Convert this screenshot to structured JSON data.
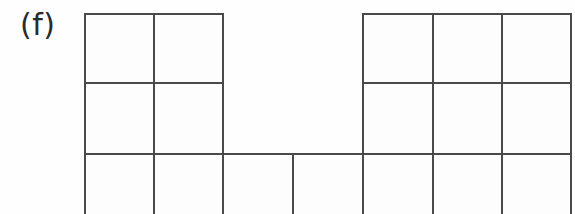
{
  "figure": {
    "panel_label": "(f)",
    "kind": "polyomino-grid-diagram",
    "background_color": "#fefefe",
    "line_color": "#4a4a4a",
    "line_width_px": 2,
    "width_px": 575,
    "height_px": 214
  },
  "grid": {
    "columns": 7,
    "rows": 3,
    "column_edges_px": [
      85,
      154,
      223,
      293,
      363,
      433,
      502,
      571
    ],
    "row_edges_px": [
      14,
      83,
      154,
      214
    ],
    "bottom_row_clipped": true,
    "filled_cells": [
      {
        "row": 0,
        "col": 0
      },
      {
        "row": 0,
        "col": 1
      },
      {
        "row": 0,
        "col": 4
      },
      {
        "row": 0,
        "col": 5
      },
      {
        "row": 0,
        "col": 6
      },
      {
        "row": 1,
        "col": 0
      },
      {
        "row": 1,
        "col": 1
      },
      {
        "row": 1,
        "col": 4
      },
      {
        "row": 1,
        "col": 5
      },
      {
        "row": 1,
        "col": 6
      },
      {
        "row": 2,
        "col": 0
      },
      {
        "row": 2,
        "col": 1
      },
      {
        "row": 2,
        "col": 2
      },
      {
        "row": 2,
        "col": 3
      },
      {
        "row": 2,
        "col": 4
      },
      {
        "row": 2,
        "col": 5
      },
      {
        "row": 2,
        "col": 6
      }
    ]
  },
  "segments": {
    "horizontal": [
      {
        "name": "top-left-block-top",
        "x1": 85,
        "x2": 223,
        "y": 14
      },
      {
        "name": "top-right-block-top",
        "x1": 363,
        "x2": 571,
        "y": 14
      },
      {
        "name": "row1-row2-divider-left",
        "x1": 85,
        "x2": 223,
        "y": 83
      },
      {
        "name": "row1-row2-divider-right",
        "x1": 363,
        "x2": 571,
        "y": 83
      },
      {
        "name": "row2-row3-divider-full",
        "x1": 85,
        "x2": 571,
        "y": 154
      }
    ],
    "vertical": [
      {
        "name": "col0-left-edge-full",
        "x": 85,
        "y1": 14,
        "y2": 214
      },
      {
        "name": "col1-divider-full",
        "x": 154,
        "y1": 14,
        "y2": 214
      },
      {
        "name": "col2-right-of-left-block",
        "x": 223,
        "y1": 14,
        "y2": 214
      },
      {
        "name": "col3-divider-bottom-row",
        "x": 293,
        "y1": 154,
        "y2": 214
      },
      {
        "name": "col4-left-of-right-block",
        "x": 363,
        "y1": 14,
        "y2": 214
      },
      {
        "name": "col5-divider-right-block",
        "x": 433,
        "y1": 14,
        "y2": 214
      },
      {
        "name": "col6-divider-right-block",
        "x": 502,
        "y1": 14,
        "y2": 214
      },
      {
        "name": "col7-right-edge",
        "x": 571,
        "y1": 14,
        "y2": 214
      }
    ]
  }
}
